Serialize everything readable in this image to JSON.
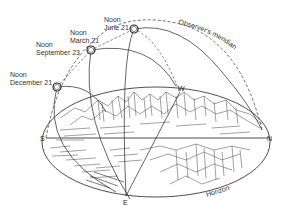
{
  "diagram": {
    "type": "sun-path-diagram",
    "sun_positions": [
      {
        "line1": "Noon",
        "line2": "June 21"
      },
      {
        "line1": "Noon",
        "line2": "March 21"
      },
      {
        "line1": "Noon",
        "line2": "September 23"
      },
      {
        "line1": "Noon",
        "line2": "December 21"
      }
    ],
    "meridian_label": "Observer's meridian",
    "horizon_label": "Horizon",
    "cardinals": {
      "north": "N",
      "south": "S",
      "east": "E",
      "west": "W"
    },
    "colors": {
      "line": "#222222",
      "text": "#333333",
      "background": "#ffffff"
    }
  }
}
